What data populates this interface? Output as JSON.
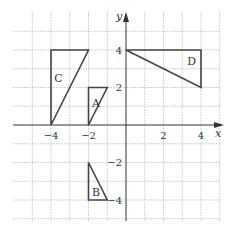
{
  "diagram": {
    "type": "coordinate-grid",
    "x_axis_label": "x",
    "y_axis_label": "y",
    "x_range": [
      -5,
      5
    ],
    "y_range": [
      -5,
      5
    ],
    "grid_step": 1,
    "x_tick_labels": [
      {
        "value": -4,
        "label": "−4"
      },
      {
        "value": -2,
        "label": "−2"
      },
      {
        "value": 2,
        "label": "2"
      },
      {
        "value": 4,
        "label": "4"
      }
    ],
    "y_tick_labels": [
      {
        "value": 4,
        "label": "4"
      },
      {
        "value": 2,
        "label": "2"
      },
      {
        "value": -2,
        "label": "−2"
      },
      {
        "value": -4,
        "label": "−4"
      }
    ],
    "shapes": [
      {
        "name": "A",
        "label": "A",
        "vertices": [
          [
            -2,
            0
          ],
          [
            -2,
            2
          ],
          [
            -1,
            2
          ]
        ],
        "label_at": [
          -1.6,
          1.2
        ]
      },
      {
        "name": "B",
        "label": "B",
        "vertices": [
          [
            -2,
            -2
          ],
          [
            -2,
            -4
          ],
          [
            -1,
            -4
          ]
        ],
        "label_at": [
          -1.6,
          -3.55
        ]
      },
      {
        "name": "C",
        "label": "C",
        "vertices": [
          [
            -4,
            0
          ],
          [
            -4,
            4
          ],
          [
            -2,
            4
          ]
        ],
        "label_at": [
          -3.6,
          2.5
        ]
      },
      {
        "name": "D",
        "label": "D",
        "vertices": [
          [
            0,
            4
          ],
          [
            4,
            4
          ],
          [
            4,
            2
          ]
        ],
        "label_at": [
          3.5,
          3.4
        ]
      }
    ],
    "colors": {
      "grid": "#b8b8b8",
      "axis": "#333333",
      "shape_stroke": "#444444"
    }
  }
}
